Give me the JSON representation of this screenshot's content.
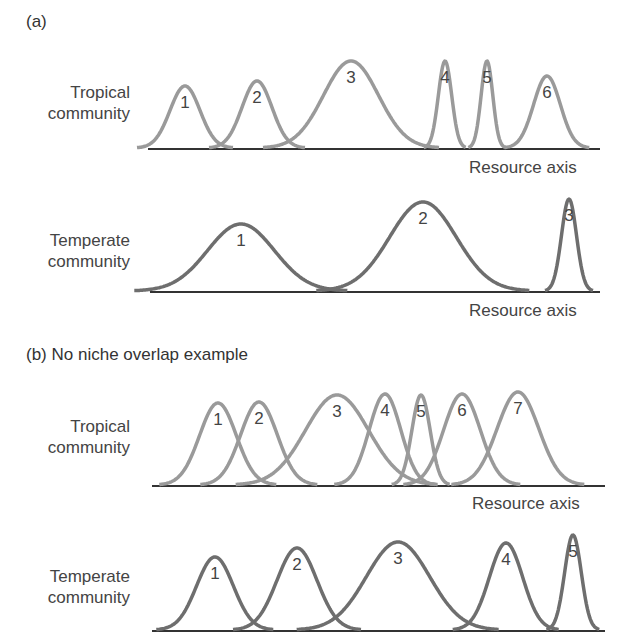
{
  "panel_a": {
    "label": "(a)",
    "tropical": {
      "row_label_1": "Tropical",
      "row_label_2": "community",
      "axis_label": "Resource axis",
      "color": "#9a9a9a",
      "baseline_y": 148,
      "x_range": [
        148,
        600
      ],
      "species": [
        {
          "id": "1",
          "center": 185,
          "top": 86,
          "width": 18
        },
        {
          "id": "2",
          "center": 257,
          "top": 81,
          "width": 18
        },
        {
          "id": "3",
          "center": 351,
          "top": 61,
          "width": 33
        },
        {
          "id": "4",
          "center": 445,
          "top": 61,
          "width": 8
        },
        {
          "id": "5",
          "center": 487,
          "top": 61,
          "width": 7
        },
        {
          "id": "6",
          "center": 547,
          "top": 76,
          "width": 16
        }
      ]
    },
    "temperate": {
      "row_label_1": "Temperate",
      "row_label_2": "community",
      "axis_label": "Resource axis",
      "color": "#6e6e6e",
      "baseline_y": 291,
      "x_range": [
        150,
        600
      ],
      "species": [
        {
          "id": "1",
          "center": 241,
          "top": 224,
          "width": 40
        },
        {
          "id": "2",
          "center": 423,
          "top": 202,
          "width": 40
        },
        {
          "id": "3",
          "center": 569,
          "top": 199,
          "width": 9
        }
      ]
    }
  },
  "panel_b": {
    "label": "(b) No niche overlap example",
    "tropical": {
      "row_label_1": "Tropical",
      "row_label_2": "community",
      "axis_label": "Resource axis",
      "color": "#9a9a9a",
      "baseline_y": 485,
      "x_range": [
        152,
        605
      ],
      "species": [
        {
          "id": "1",
          "center": 218,
          "top": 403,
          "width": 22
        },
        {
          "id": "2",
          "center": 259,
          "top": 402,
          "width": 22
        },
        {
          "id": "3",
          "center": 337,
          "top": 395,
          "width": 38
        },
        {
          "id": "4",
          "center": 385,
          "top": 394,
          "width": 19
        },
        {
          "id": "5",
          "center": 421,
          "top": 395,
          "width": 11
        },
        {
          "id": "6",
          "center": 462,
          "top": 394,
          "width": 22
        },
        {
          "id": "7",
          "center": 518,
          "top": 392,
          "width": 25
        }
      ]
    },
    "temperate": {
      "row_label_1": "Temperate",
      "row_label_2": "community",
      "color": "#6e6e6e",
      "baseline_y": 630,
      "x_range": [
        152,
        605
      ],
      "species": [
        {
          "id": "1",
          "center": 215,
          "top": 557,
          "width": 22
        },
        {
          "id": "2",
          "center": 297,
          "top": 548,
          "width": 24
        },
        {
          "id": "3",
          "center": 398,
          "top": 542,
          "width": 38
        },
        {
          "id": "4",
          "center": 506,
          "top": 543,
          "width": 20
        },
        {
          "id": "5",
          "center": 573,
          "top": 535,
          "width": 10
        }
      ]
    }
  }
}
